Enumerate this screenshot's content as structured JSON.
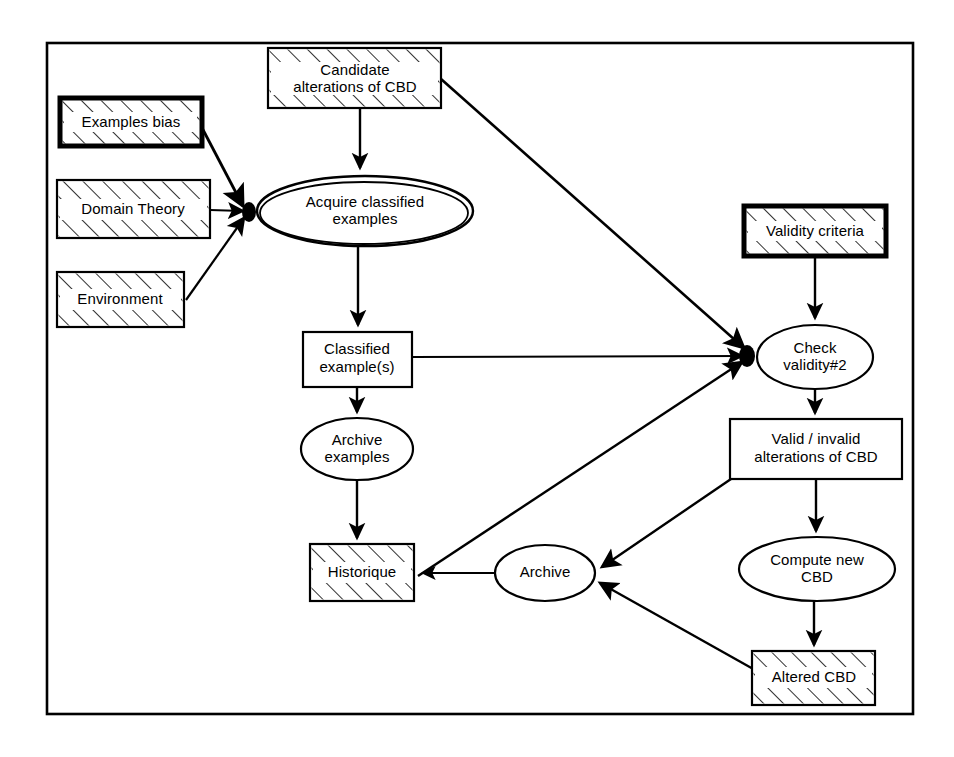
{
  "diagram": {
    "frame": {
      "label": "diagram-frame"
    },
    "colors": {
      "stroke": "#000000",
      "background": "#ffffff",
      "hatch": "#000000"
    },
    "nodes": [
      {
        "id": "examples-bias",
        "label": "Examples bias",
        "shape": "rectangle",
        "style": "hatched-thick",
        "x": 60,
        "y": 98,
        "w": 142,
        "h": 48
      },
      {
        "id": "domain-theory",
        "label": "Domain Theory",
        "shape": "rectangle",
        "style": "hatched",
        "x": 57,
        "y": 180,
        "w": 153,
        "h": 58
      },
      {
        "id": "environment",
        "label": "Environment",
        "shape": "rectangle",
        "style": "hatched",
        "x": 57,
        "y": 272,
        "w": 127,
        "h": 55
      },
      {
        "id": "candidate-alterations-of-cbd",
        "label": "Candidate\nalterations of CBD",
        "line1": "Candidate",
        "line2": "alterations of CBD",
        "shape": "rectangle",
        "style": "hatched",
        "x": 268,
        "y": 48,
        "w": 173,
        "h": 60
      },
      {
        "id": "acquire-classified-examples",
        "label": "Acquire classified\nexamples",
        "line1": "Acquire classified",
        "line2": "examples",
        "shape": "ellipse-double",
        "style": "plain",
        "cx": 365,
        "cy": 211,
        "rx": 108,
        "ry": 35
      },
      {
        "id": "classified-examples",
        "label": "Classified\nexample(s)",
        "line1": "Classified",
        "line2": "example(s)",
        "shape": "rectangle",
        "style": "plain",
        "x": 303,
        "y": 332,
        "w": 109,
        "h": 55
      },
      {
        "id": "archive-examples",
        "label": "Archive\nexamples",
        "line1": "Archive",
        "line2": "examples",
        "shape": "ellipse",
        "style": "plain",
        "cx": 357,
        "cy": 449,
        "rx": 56,
        "ry": 31
      },
      {
        "id": "historique",
        "label": "Historique",
        "shape": "rectangle",
        "style": "hatched",
        "x": 310,
        "y": 544,
        "w": 104,
        "h": 57
      },
      {
        "id": "archive",
        "label": "Archive",
        "shape": "ellipse",
        "style": "plain",
        "cx": 545,
        "cy": 573,
        "rx": 50,
        "ry": 28
      },
      {
        "id": "validity-criteria",
        "label": "Validity criteria",
        "shape": "rectangle",
        "style": "hatched-thick",
        "x": 744,
        "y": 206,
        "w": 142,
        "h": 50
      },
      {
        "id": "check-validity-2",
        "label": "Check\nvalidity#2",
        "line1": "Check",
        "line2": "validity#2",
        "shape": "ellipse",
        "cx": 815,
        "cy": 357,
        "rx": 58,
        "ry": 32
      },
      {
        "id": "valid-invalid-alterations-of-cbd",
        "label": "Valid / invalid\nalterations of CBD",
        "line1": "Valid / invalid",
        "line2": "alterations of CBD",
        "shape": "rectangle",
        "style": "plain",
        "x": 730,
        "y": 419,
        "w": 172,
        "h": 60
      },
      {
        "id": "compute-new-cbd",
        "label": "Compute new\nCBD",
        "line1": "Compute new",
        "line2": "CBD",
        "shape": "ellipse",
        "style": "plain",
        "cx": 817,
        "cy": 569,
        "rx": 78,
        "ry": 32
      },
      {
        "id": "altered-cbd",
        "label": "Altered CBD",
        "shape": "rectangle",
        "style": "hatched",
        "x": 752,
        "y": 651,
        "w": 123,
        "h": 54
      }
    ],
    "edges": [
      {
        "id": "e1",
        "from": "examples-bias",
        "to": "acquire-classified-examples",
        "arrow": true
      },
      {
        "id": "e2",
        "from": "domain-theory",
        "to": "acquire-classified-examples",
        "arrow": true
      },
      {
        "id": "e3",
        "from": "environment",
        "to": "acquire-classified-examples",
        "arrow": true
      },
      {
        "id": "e4",
        "from": "candidate-alterations-of-cbd",
        "to": "acquire-classified-examples",
        "arrow": true
      },
      {
        "id": "e5",
        "from": "candidate-alterations-of-cbd",
        "to": "check-validity-2",
        "arrow": true
      },
      {
        "id": "e6",
        "from": "acquire-classified-examples",
        "to": "classified-examples",
        "arrow": true
      },
      {
        "id": "e7",
        "from": "classified-examples",
        "to": "check-validity-2",
        "arrow": true
      },
      {
        "id": "e8",
        "from": "classified-examples",
        "to": "archive-examples",
        "arrow": true
      },
      {
        "id": "e9",
        "from": "archive-examples",
        "to": "historique",
        "arrow": true
      },
      {
        "id": "e10",
        "from": "archive",
        "to": "historique",
        "arrow": true
      },
      {
        "id": "e11",
        "from": "archive",
        "to": "check-validity-2",
        "arrow": true
      },
      {
        "id": "e12",
        "from": "validity-criteria",
        "to": "check-validity-2",
        "arrow": true
      },
      {
        "id": "e13",
        "from": "check-validity-2",
        "to": "valid-invalid-alterations-of-cbd",
        "arrow": true
      },
      {
        "id": "e14",
        "from": "valid-invalid-alterations-of-cbd",
        "to": "archive",
        "arrow": true
      },
      {
        "id": "e15",
        "from": "valid-invalid-alterations-of-cbd",
        "to": "compute-new-cbd",
        "arrow": true
      },
      {
        "id": "e16",
        "from": "compute-new-cbd",
        "to": "altered-cbd",
        "arrow": true
      },
      {
        "id": "e17",
        "from": "altered-cbd",
        "to": "archive",
        "arrow": true
      }
    ]
  }
}
